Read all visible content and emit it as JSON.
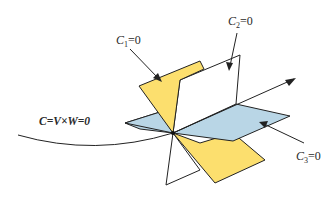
{
  "diagram": {
    "labels": {
      "c1": {
        "var": "C",
        "sub": "1",
        "eq": "=0"
      },
      "c2": {
        "var": "C",
        "sub": "2",
        "eq": "=0"
      },
      "c3": {
        "var": "C",
        "sub": "3",
        "eq": "=0"
      },
      "main": "C=V×W=0"
    },
    "colors": {
      "yellow_plane": "#fcdf6e",
      "blue_plane": "#b9d6e6",
      "white_plane": "#ffffff",
      "stroke": "#222222",
      "background": "#ffffff"
    }
  }
}
